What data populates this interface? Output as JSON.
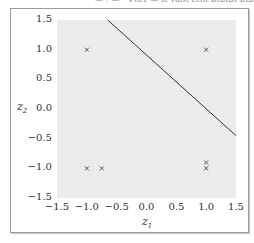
{
  "header": {
    "cutoff_text": "— . — · VtoT — it vdot etot btbtbt btbtbt"
  },
  "chart_data": {
    "type": "scatter",
    "title": "",
    "xlabel": "z1",
    "ylabel": "z2",
    "xlim": [
      -1.5,
      1.5
    ],
    "ylim": [
      -1.5,
      1.5
    ],
    "grid": false,
    "xticks": [
      "−1.5",
      "−1.0",
      "−0.5",
      "0.0",
      "0.5",
      "1.0",
      "1.5"
    ],
    "yticks": [
      "1.5",
      "1.0",
      "0.5",
      "0.0",
      "−0.5",
      "−1.0",
      "−1.5"
    ],
    "series": [
      {
        "name": "points",
        "marker": "x",
        "color": "#555555",
        "points": [
          [
            -1.0,
            1.0
          ],
          [
            1.0,
            1.0
          ],
          [
            -1.0,
            -1.0
          ],
          [
            -0.75,
            -1.0
          ],
          [
            1.0,
            -0.9
          ],
          [
            1.0,
            -1.0
          ]
        ]
      }
    ],
    "lines": [
      {
        "name": "decision-boundary",
        "color": "#333333",
        "from": [
          -0.65,
          1.5
        ],
        "to": [
          1.5,
          -0.45
        ]
      }
    ]
  },
  "labels": {
    "ylabel_main": "z",
    "ylabel_sub": "2",
    "xlabel_main": "z",
    "xlabel_sub": "1"
  }
}
